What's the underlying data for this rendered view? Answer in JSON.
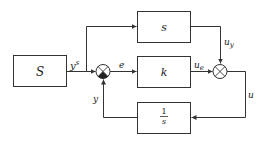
{
  "diagram": {
    "blocks": {
      "source": "S",
      "feedforward": "s",
      "controller": "k",
      "integrator_num": "1",
      "integrator_den": "s"
    },
    "signals": {
      "ys_base": "y",
      "ys_sup": "s",
      "e": "e",
      "ue_base": "u",
      "ue_sub": "e",
      "uy_base": "u",
      "uy_sub": "y",
      "u": "u",
      "y": "y"
    },
    "colors": {
      "stroke": "#333333",
      "background": "#ffffff"
    }
  }
}
